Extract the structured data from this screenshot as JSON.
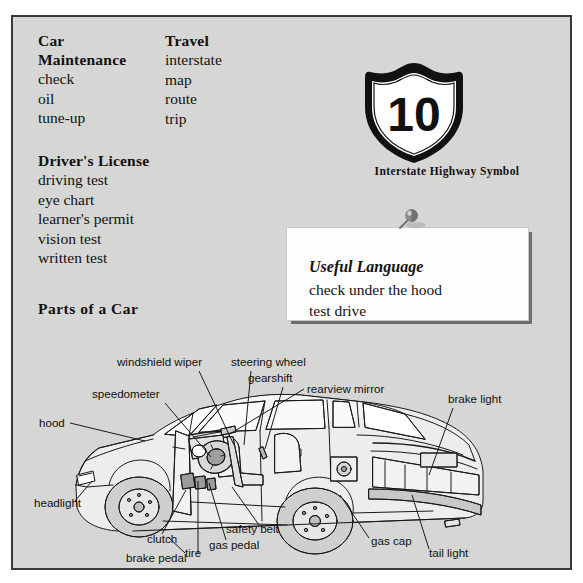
{
  "page": {
    "background_color": "#d6d6d4",
    "border_color": "#3a3a3a"
  },
  "vocabulary": {
    "columns": [
      {
        "id": "car-maintenance",
        "heading_line1": "Car",
        "heading_line2": "Maintenance",
        "items": [
          "check",
          "oil",
          "tune-up"
        ]
      },
      {
        "id": "travel",
        "heading_line1": "Travel",
        "heading_line2": "",
        "items": [
          "interstate",
          "map",
          "route",
          "trip"
        ]
      },
      {
        "id": "drivers-license",
        "heading_line1": "Driver's License",
        "heading_line2": "",
        "items": [
          "driving test",
          "eye chart",
          "learner's permit",
          "vision test",
          "written test"
        ]
      }
    ],
    "parts_heading": "Parts of a Car"
  },
  "shield": {
    "number": "10",
    "caption": "Interstate Highway Symbol",
    "icon": "interstate-shield-icon",
    "body_color": "#ffffff",
    "outline_color": "#111111"
  },
  "useful_language": {
    "pin_icon": "pushpin-icon",
    "title": "Useful Language",
    "lines": [
      "check under the hood",
      "test drive"
    ],
    "card_color": "#fdfdfd",
    "shadow_color": "#6f6f6f"
  },
  "diagram": {
    "title": "Parts of a Car",
    "labels": [
      {
        "id": "windshield-wiper",
        "text": "windshield wiper",
        "x": 104,
        "y": 31,
        "anchor": "start",
        "line": [
          [
            186,
            36
          ],
          [
            221,
            110
          ]
        ]
      },
      {
        "id": "steering-wheel",
        "text": "steering wheel",
        "x": 218,
        "y": 31,
        "anchor": "start",
        "line": [
          [
            238,
            36
          ],
          [
            231,
            110
          ]
        ]
      },
      {
        "id": "gearshift",
        "text": "gearshift",
        "x": 235,
        "y": 47,
        "anchor": "start",
        "line": [
          [
            270,
            52
          ],
          [
            252,
            114
          ]
        ]
      },
      {
        "id": "rearview-mirror",
        "text": "rearview mirror",
        "x": 294,
        "y": 58,
        "anchor": "start",
        "line": [
          [
            291,
            54
          ],
          [
            215,
            100
          ]
        ]
      },
      {
        "id": "speedometer",
        "text": "speedometer",
        "x": 79,
        "y": 63,
        "anchor": "start",
        "line": [
          [
            152,
            68
          ],
          [
            198,
            122
          ]
        ]
      },
      {
        "id": "brake-light",
        "text": "brake light",
        "x": 435,
        "y": 68,
        "anchor": "start",
        "line": [
          [
            440,
            73
          ],
          [
            416,
            140
          ]
        ]
      },
      {
        "id": "hood",
        "text": "hood",
        "x": 26,
        "y": 92,
        "anchor": "start",
        "line": [
          [
            57,
            88
          ],
          [
            132,
            106
          ]
        ]
      },
      {
        "id": "headlight",
        "text": "headlight",
        "x": 21,
        "y": 172,
        "anchor": "start",
        "line": [
          [
            62,
            166
          ],
          [
            79,
            146
          ]
        ]
      },
      {
        "id": "clutch",
        "text": "clutch",
        "x": 134,
        "y": 208,
        "anchor": "start",
        "line": [
          [
            149,
            199
          ],
          [
            173,
            155
          ]
        ]
      },
      {
        "id": "brake-pedal",
        "text": "brake pedal",
        "x": 113,
        "y": 227,
        "anchor": "start",
        "line": [
          [
            185,
            219
          ],
          [
            185,
            146
          ]
        ]
      },
      {
        "id": "gas-pedal",
        "text": "gas pedal",
        "x": 196,
        "y": 214,
        "anchor": "start",
        "line": [
          [
            213,
            205
          ],
          [
            196,
            148
          ]
        ]
      },
      {
        "id": "safety-belt",
        "text": "safety belt",
        "x": 213,
        "y": 198,
        "anchor": "start",
        "line": [
          [
            246,
            190
          ],
          [
            219,
            152
          ]
        ]
      },
      {
        "id": "gas-cap",
        "text": "gas cap",
        "x": 358,
        "y": 210,
        "anchor": "start",
        "line": [
          [
            356,
            203
          ],
          [
            327,
            160
          ]
        ]
      },
      {
        "id": "tire",
        "text": "tire",
        "x": 172,
        "y": 222,
        "anchor": "start",
        "line": [
          [
            172,
            218
          ],
          [
            155,
            202
          ]
        ]
      },
      {
        "id": "tail-light",
        "text": "tail light",
        "x": 416,
        "y": 222,
        "anchor": "start",
        "line": [
          [
            416,
            214
          ],
          [
            399,
            160
          ]
        ]
      }
    ],
    "body_fill": "#ececea",
    "line_color": "#1a1a1a"
  }
}
